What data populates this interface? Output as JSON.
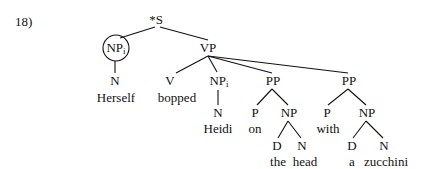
{
  "example_number": "18)",
  "tree": {
    "root": {
      "label": "*S"
    },
    "subject": {
      "label": "NP",
      "index": "i",
      "circled": true,
      "child": {
        "label": "N",
        "word": "Herself"
      }
    },
    "vp": {
      "label": "VP",
      "verb": {
        "label": "V",
        "word": "bopped"
      },
      "object": {
        "label": "NP",
        "index": "i",
        "child": {
          "label": "N",
          "word": "Heidi"
        }
      },
      "pp1": {
        "label": "PP",
        "p": {
          "label": "P",
          "word": "on"
        },
        "np": {
          "label": "NP",
          "d": {
            "label": "D",
            "word": "the"
          },
          "n": {
            "label": "N",
            "word": "head"
          }
        }
      },
      "pp2": {
        "label": "PP",
        "p": {
          "label": "P",
          "word": "with"
        },
        "np": {
          "label": "NP",
          "d": {
            "label": "D",
            "word": "a"
          },
          "n": {
            "label": "N",
            "word": "zucchini"
          }
        }
      }
    }
  }
}
